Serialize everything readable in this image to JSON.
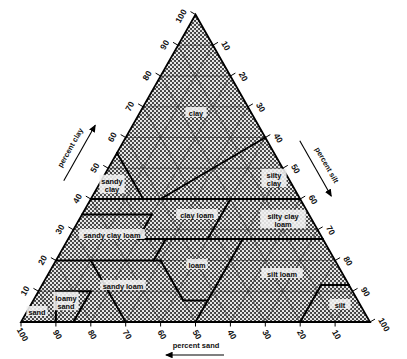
{
  "figure": {
    "type": "ternary-diagram",
    "background_color": "#ffffff",
    "line_color": "#000000",
    "fill_pattern": "stipple-halftone",
    "fill_color": "#4a4a4a"
  },
  "axes": {
    "left": {
      "name": "percent clay",
      "label": "percent clay",
      "arrow": "up",
      "ticks": [
        "100",
        "90",
        "80",
        "70",
        "60",
        "50",
        "40",
        "30",
        "20",
        "10"
      ],
      "tick_rotation": "-60"
    },
    "right": {
      "name": "percent silt",
      "label": "percent silt",
      "arrow": "down",
      "ticks": [
        "10",
        "20",
        "30",
        "40",
        "50",
        "60",
        "70",
        "80",
        "90",
        "100"
      ],
      "tick_rotation": "60"
    },
    "bottom": {
      "name": "percent sand",
      "label": "percent sand",
      "arrow": "left",
      "ticks": [
        "100",
        "90",
        "80",
        "70",
        "60",
        "50",
        "40",
        "30",
        "20",
        "10"
      ],
      "tick_rotation": "60"
    }
  },
  "apex_label": "100",
  "regions": [
    {
      "id": "clay",
      "label": "clay",
      "lines": [
        "clay"
      ],
      "cx": 196,
      "cy": 116
    },
    {
      "id": "silty-clay",
      "label": "silty clay",
      "lines": [
        "silty",
        "clay"
      ],
      "cx": 274,
      "cy": 182
    },
    {
      "id": "sandy-clay",
      "label": "sandy clay",
      "lines": [
        "sandy",
        "clay"
      ],
      "cx": 112,
      "cy": 188
    },
    {
      "id": "clay-loam",
      "label": "clay loam",
      "lines": [
        "clay loam"
      ],
      "cx": 197,
      "cy": 218
    },
    {
      "id": "silty-clay-loam",
      "label": "silty clay loam",
      "lines": [
        "silty clay",
        "loam"
      ],
      "cx": 283,
      "cy": 223
    },
    {
      "id": "sandy-clay-loam",
      "label": "sandy clay loam",
      "lines": [
        "sandy clay loam"
      ],
      "cx": 112,
      "cy": 238
    },
    {
      "id": "loam",
      "label": "loam",
      "lines": [
        "loam"
      ],
      "cx": 197,
      "cy": 268
    },
    {
      "id": "silt-loam",
      "label": "silt loam",
      "lines": [
        "silt loam"
      ],
      "cx": 282,
      "cy": 277
    },
    {
      "id": "sandy-loam",
      "label": "sandy loam",
      "lines": [
        "sandy loam"
      ],
      "cx": 123,
      "cy": 289
    },
    {
      "id": "loamy-sand",
      "label": "loamy sand",
      "lines": [
        "loamy",
        "sand"
      ],
      "cx": 66,
      "cy": 305
    },
    {
      "id": "sand",
      "label": "sand",
      "lines": [
        "sand"
      ],
      "cx": 37,
      "cy": 315
    },
    {
      "id": "silt",
      "label": "silt",
      "lines": [
        "silt"
      ],
      "cx": 340,
      "cy": 308
    }
  ],
  "chart_data": {
    "type": "ternary",
    "axis_names": [
      "percent clay",
      "percent silt",
      "percent sand"
    ],
    "axis_ranges": [
      [
        0,
        100
      ],
      [
        0,
        100
      ],
      [
        0,
        100
      ]
    ],
    "tick_interval": 10,
    "grid": true,
    "legend": "none",
    "classes": [
      {
        "name": "clay",
        "clay_range": [
          40,
          100
        ],
        "silt_range": [
          0,
          40
        ],
        "sand_range": [
          0,
          45
        ]
      },
      {
        "name": "silty clay",
        "clay_range": [
          40,
          60
        ],
        "silt_range": [
          40,
          60
        ],
        "sand_range": [
          0,
          20
        ]
      },
      {
        "name": "sandy clay",
        "clay_range": [
          35,
          55
        ],
        "silt_range": [
          0,
          20
        ],
        "sand_range": [
          45,
          65
        ]
      },
      {
        "name": "clay loam",
        "clay_range": [
          27,
          40
        ],
        "silt_range": [
          15,
          53
        ],
        "sand_range": [
          20,
          45
        ]
      },
      {
        "name": "silty clay loam",
        "clay_range": [
          27,
          40
        ],
        "silt_range": [
          40,
          73
        ],
        "sand_range": [
          0,
          20
        ]
      },
      {
        "name": "sandy clay loam",
        "clay_range": [
          20,
          35
        ],
        "silt_range": [
          0,
          28
        ],
        "sand_range": [
          45,
          80
        ]
      },
      {
        "name": "loam",
        "clay_range": [
          7,
          27
        ],
        "silt_range": [
          28,
          50
        ],
        "sand_range": [
          23,
          52
        ]
      },
      {
        "name": "silt loam",
        "clay_range": [
          0,
          27
        ],
        "silt_range": [
          50,
          88
        ],
        "sand_range": [
          0,
          50
        ]
      },
      {
        "name": "sandy loam",
        "clay_range": [
          0,
          20
        ],
        "silt_range": [
          0,
          50
        ],
        "sand_range": [
          43,
          85
        ]
      },
      {
        "name": "loamy sand",
        "clay_range": [
          0,
          15
        ],
        "silt_range": [
          0,
          30
        ],
        "sand_range": [
          70,
          90
        ]
      },
      {
        "name": "sand",
        "clay_range": [
          0,
          10
        ],
        "silt_range": [
          0,
          15
        ],
        "sand_range": [
          85,
          100
        ]
      },
      {
        "name": "silt",
        "clay_range": [
          0,
          12
        ],
        "silt_range": [
          80,
          100
        ],
        "sand_range": [
          0,
          20
        ]
      }
    ]
  }
}
